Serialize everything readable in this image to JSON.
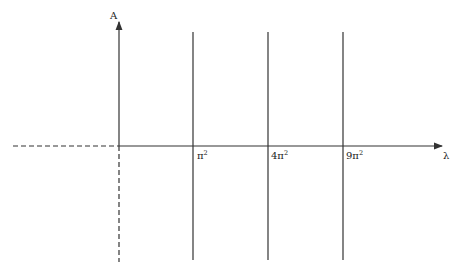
{
  "diagram": {
    "y_axis_label": "A",
    "x_axis_label": "λ",
    "vertical_lines": [
      {
        "label_base": "π",
        "label_sup": "2"
      },
      {
        "label_base": "4π",
        "label_sup": "2"
      },
      {
        "label_base": "9π",
        "label_sup": "2"
      }
    ],
    "colors": {
      "line": "#333333",
      "background": "#ffffff"
    }
  }
}
